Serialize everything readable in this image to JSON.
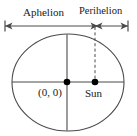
{
  "figure": {
    "labels": {
      "aphelion": "Aphelion",
      "perihelion": "Perihelion",
      "origin": "(0, 0)",
      "sun": "Sun"
    },
    "colors": {
      "stroke": "#3d3d3d",
      "text": "#1a1a1a",
      "dot": "#000000",
      "background": "#ffffff"
    },
    "geometry": {
      "ellipse_center_x": 68,
      "ellipse_center_y": 82.5,
      "ellipse_radius_x": 56,
      "ellipse_radius_y": 48.5,
      "origin_dot_x": 67,
      "origin_dot_y": 82,
      "sun_dot_x": 95,
      "sun_dot_y": 82,
      "dot_radius": 3.2,
      "dimension_line_y": 26,
      "dimension_left_x": 5,
      "dimension_split_x": 98,
      "dimension_right_x": 128,
      "dashed_line_x": 95,
      "dashed_line_top_y": 27,
      "minor_axis_x": 67
    }
  }
}
